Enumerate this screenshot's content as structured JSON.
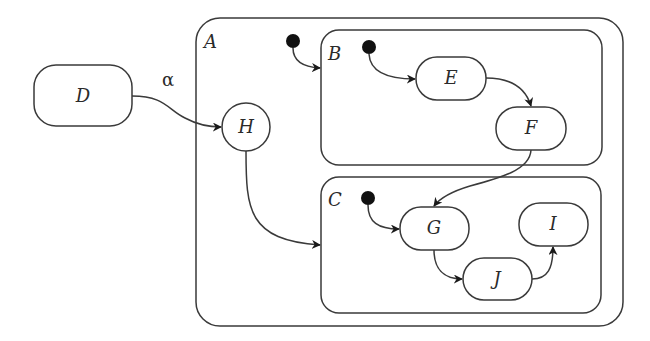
{
  "diagram": {
    "type": "statechart",
    "states": {
      "A": {
        "label": "A",
        "kind": "composite"
      },
      "B": {
        "label": "B",
        "kind": "composite",
        "parent": "A"
      },
      "C": {
        "label": "C",
        "kind": "composite",
        "parent": "A"
      },
      "D": {
        "label": "D",
        "kind": "state"
      },
      "E": {
        "label": "E",
        "kind": "state",
        "parent": "B"
      },
      "F": {
        "label": "F",
        "kind": "state",
        "parent": "B"
      },
      "G": {
        "label": "G",
        "kind": "state",
        "parent": "C"
      },
      "H": {
        "label": "H",
        "kind": "history",
        "parent": "A"
      },
      "I": {
        "label": "I",
        "kind": "state",
        "parent": "C"
      },
      "J": {
        "label": "J",
        "kind": "state",
        "parent": "C"
      }
    },
    "transitions": [
      {
        "from": "D",
        "to": "H",
        "label": "α"
      },
      {
        "from": "initial-A",
        "to": "B",
        "label": ""
      },
      {
        "from": "initial-B",
        "to": "E",
        "label": ""
      },
      {
        "from": "E",
        "to": "F",
        "label": ""
      },
      {
        "from": "F",
        "to": "G",
        "label": ""
      },
      {
        "from": "H",
        "to": "C",
        "label": ""
      },
      {
        "from": "initial-C",
        "to": "G",
        "label": ""
      },
      {
        "from": "G",
        "to": "J",
        "label": ""
      },
      {
        "from": "J",
        "to": "I",
        "label": ""
      }
    ],
    "edge_label_alpha": "α",
    "colors": {
      "stroke": "#3a3a3a",
      "initial_dot": "#111111",
      "background": "#ffffff"
    }
  }
}
